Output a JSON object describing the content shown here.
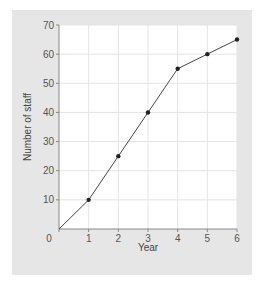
{
  "chart_data": {
    "type": "line",
    "title": "",
    "xlabel": "Year",
    "ylabel": "Number of staff",
    "x": [
      0,
      1,
      2,
      3,
      4,
      5,
      6
    ],
    "series": [
      {
        "name": "Number of staff",
        "values": [
          0,
          10,
          25,
          40,
          55,
          60,
          65
        ]
      }
    ],
    "x_ticks": [
      "0",
      "1",
      "2",
      "3",
      "4",
      "5",
      "6"
    ],
    "y_ticks": [
      "10",
      "20",
      "30",
      "40",
      "50",
      "60",
      "70"
    ],
    "xlim": [
      0,
      6
    ],
    "ylim": [
      0,
      70
    ],
    "grid": true,
    "markers": true,
    "legend": "none"
  },
  "colors": {
    "panel_background": "#e6e6e6",
    "plot_background": "#ffffff",
    "grid": "#e4e4e4",
    "line": "#444444",
    "marker": "#222222",
    "axis": "#888888",
    "text": "#555555"
  }
}
